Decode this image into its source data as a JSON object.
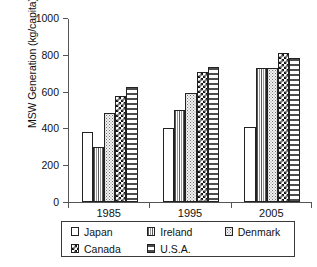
{
  "chart_data": {
    "type": "bar",
    "title": "",
    "subtitle": "",
    "xlabel": "",
    "ylabel": "MSW Generation (kg/capita)",
    "categories": [
      "1985",
      "1995",
      "2005"
    ],
    "series": [
      {
        "name": "Japan",
        "values": [
          380,
          402,
          405
        ],
        "pattern": "white-empty",
        "swatch_class": "pat-japan"
      },
      {
        "name": "Ireland",
        "values": [
          300,
          502,
          728
        ],
        "pattern": "vertical-stripes",
        "swatch_class": "pat-ireland"
      },
      {
        "name": "Denmark",
        "values": [
          486,
          590,
          728
        ],
        "pattern": "fine-dots",
        "swatch_class": "pat-denmark"
      },
      {
        "name": "Canada",
        "values": [
          574,
          706,
          810
        ],
        "pattern": "checkerboard",
        "swatch_class": "pat-canada"
      },
      {
        "name": "U.S.A.",
        "values": [
          624,
          736,
          780
        ],
        "pattern": "vertical-dashes",
        "swatch_class": "pat-usa"
      }
    ],
    "ylim": [
      0,
      1000
    ],
    "yticks": [
      0,
      200,
      400,
      600,
      800,
      1000
    ],
    "ytick_labels": [
      "0",
      "200",
      "400",
      "600",
      "800",
      "1000"
    ],
    "grid": false,
    "legend_position": "below-axis",
    "legend_entries": [
      {
        "label": "Japan",
        "swatch_class": "pat-japan"
      },
      {
        "label": "Ireland",
        "swatch_class": "pat-ireland"
      },
      {
        "label": "Denmark",
        "swatch_class": "pat-denmark"
      },
      {
        "label": "Canada",
        "swatch_class": "pat-canada"
      },
      {
        "label": "U.S.A.",
        "swatch_class": "pat-usa"
      }
    ],
    "colors": {
      "axis": "#555555",
      "text": "#111111",
      "bar_outline": "#222222",
      "background": "#ffffff"
    }
  }
}
